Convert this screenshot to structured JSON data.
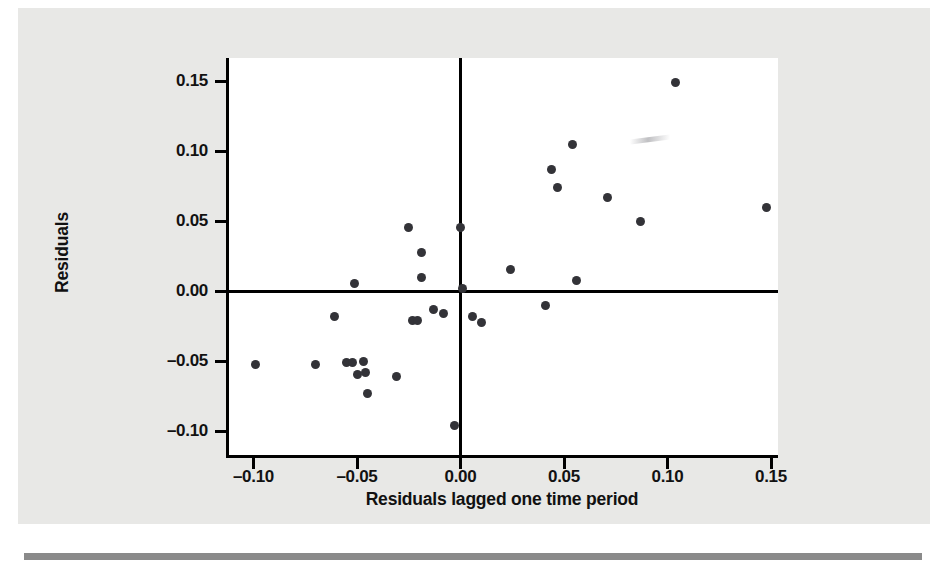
{
  "figure": {
    "background_color": "#e8e8e6",
    "plot_background_color": "#ffffff",
    "axis_color": "#000000",
    "marker_color": "#333338"
  },
  "chart_data": {
    "type": "scatter",
    "title": "",
    "xlabel": "Residuals lagged one time period",
    "ylabel": "Residuals",
    "xlim": [
      -0.118,
      0.155
    ],
    "ylim": [
      -0.117,
      0.168
    ],
    "xticks": [
      -0.1,
      -0.05,
      0.0,
      0.05,
      0.1,
      0.15
    ],
    "xticklabels": [
      "-0.10",
      "-0.05",
      "0.00",
      "0.05",
      "0.10",
      "0.15"
    ],
    "yticks": [
      -0.1,
      -0.05,
      0.0,
      0.05,
      0.1,
      0.15
    ],
    "yticklabels": [
      "-0.10",
      "-0.05",
      "0.00",
      "0.05",
      "0.10",
      "0.15"
    ],
    "grid": false,
    "legend": null,
    "reference_lines": [
      {
        "orientation": "horizontal",
        "value": 0.0
      },
      {
        "orientation": "vertical",
        "value": 0.0
      }
    ],
    "points": [
      {
        "x": -0.099,
        "y": -0.052
      },
      {
        "x": -0.07,
        "y": -0.052
      },
      {
        "x": -0.061,
        "y": -0.018
      },
      {
        "x": -0.055,
        "y": -0.051
      },
      {
        "x": -0.052,
        "y": -0.051
      },
      {
        "x": -0.051,
        "y": 0.006
      },
      {
        "x": -0.05,
        "y": -0.059
      },
      {
        "x": -0.047,
        "y": -0.05
      },
      {
        "x": -0.046,
        "y": -0.058
      },
      {
        "x": -0.045,
        "y": -0.073
      },
      {
        "x": -0.031,
        "y": -0.061
      },
      {
        "x": -0.025,
        "y": 0.046
      },
      {
        "x": -0.023,
        "y": -0.021
      },
      {
        "x": -0.021,
        "y": -0.021
      },
      {
        "x": -0.019,
        "y": 0.028
      },
      {
        "x": -0.019,
        "y": 0.01
      },
      {
        "x": -0.013,
        "y": -0.013
      },
      {
        "x": -0.008,
        "y": -0.016
      },
      {
        "x": -0.003,
        "y": -0.096
      },
      {
        "x": 0.0,
        "y": 0.046
      },
      {
        "x": 0.001,
        "y": 0.002
      },
      {
        "x": 0.006,
        "y": -0.018
      },
      {
        "x": 0.01,
        "y": -0.022
      },
      {
        "x": 0.024,
        "y": 0.016
      },
      {
        "x": 0.041,
        "y": -0.01
      },
      {
        "x": 0.044,
        "y": 0.087
      },
      {
        "x": 0.047,
        "y": 0.074
      },
      {
        "x": 0.054,
        "y": 0.105
      },
      {
        "x": 0.056,
        "y": 0.008
      },
      {
        "x": 0.071,
        "y": 0.067
      },
      {
        "x": 0.087,
        "y": 0.05
      },
      {
        "x": 0.104,
        "y": 0.149
      },
      {
        "x": 0.148,
        "y": 0.06
      }
    ]
  }
}
